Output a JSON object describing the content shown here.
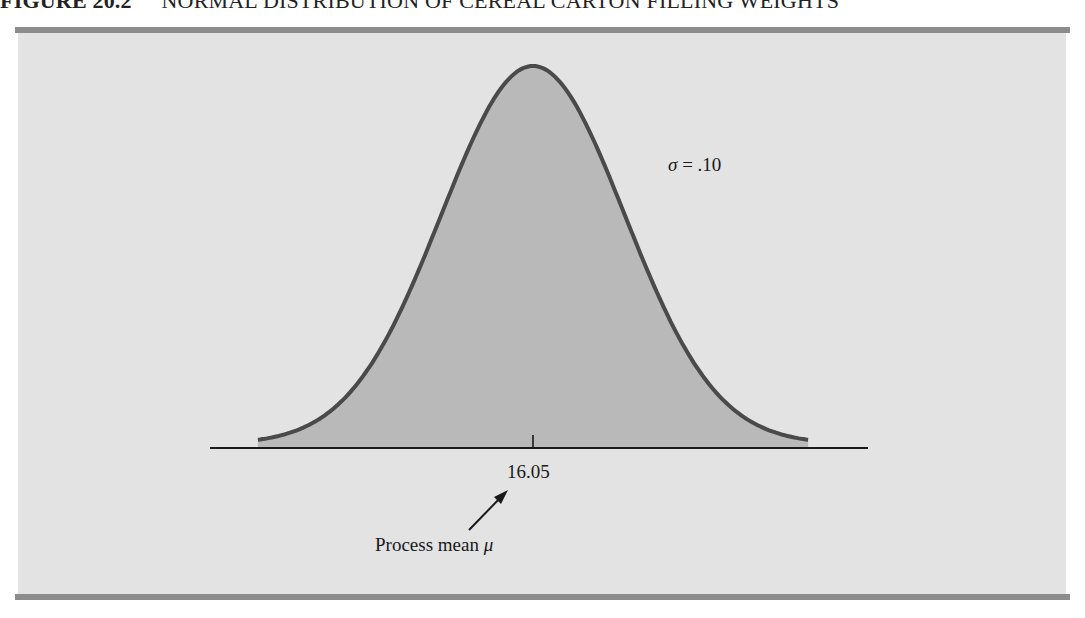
{
  "title": {
    "figure_number": "FIGURE 20.2",
    "text": "NORMAL DISTRIBUTION OF CEREAL CARTON FILLING WEIGHTS"
  },
  "colors": {
    "panel_bg": "#e3e3e3",
    "rule": "#8c8c8c",
    "curve_fill": "#b9b9b9",
    "curve_stroke": "#4a4a4a",
    "axis": "#1a1a1a"
  },
  "annotations": {
    "sigma_symbol": "σ",
    "sigma_text": " = .10",
    "mean_value": "16.05",
    "process_mean_text": "Process mean ",
    "mu_symbol": "μ"
  },
  "chart_data": {
    "type": "area",
    "title": "NORMAL DISTRIBUTION OF CEREAL CARTON FILLING WEIGHTS",
    "distribution": "normal",
    "mean": 16.05,
    "std_dev": 0.1,
    "x_range": [
      15.75,
      16.35
    ],
    "xlabel": "",
    "ylabel": "",
    "x_ticks": [
      16.05
    ],
    "x_tick_labels": [
      "16.05"
    ],
    "annotations": [
      "σ = .10",
      "Process mean μ (arrow to 16.05)"
    ],
    "grid": false,
    "legend": null,
    "render": {
      "center_px": 533,
      "sigma_px": 91.7,
      "baseline_px": 440,
      "peak_px": 62,
      "z_extent": 3,
      "axis_y": 448,
      "axis_x": [
        210,
        868
      ],
      "tick_y": [
        435,
        448
      ]
    }
  }
}
